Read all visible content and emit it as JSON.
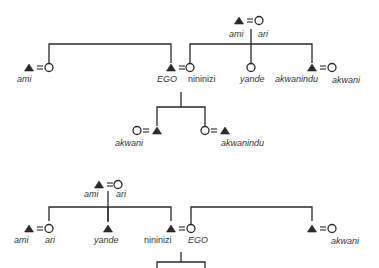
{
  "diagram": {
    "type": "kinship",
    "top": {
      "parents": {
        "male": {
          "label": "ami"
        },
        "female": {
          "label": "ari"
        }
      },
      "left_couple": {
        "male": {
          "label": "ami"
        }
      },
      "ego_couple": {
        "male": {
          "label": "EGO"
        },
        "female": {
          "label": "nininizi"
        }
      },
      "siblings_of_wife": [
        {
          "sex": "female",
          "label": "yande"
        },
        {
          "sex": "male",
          "label": "akwanindu",
          "spouse_label": "akwani"
        }
      ],
      "children": [
        {
          "label": "akwani"
        },
        {
          "label": "akwanindu"
        }
      ]
    },
    "bottom": {
      "parents": {
        "male": {
          "label": "ami"
        },
        "female": {
          "label": "ari"
        }
      },
      "children": [
        {
          "male_label": "ami",
          "female_label": "ari"
        },
        {
          "sex": "male",
          "label": "yande"
        },
        {
          "male_label": "nininizi",
          "female_label": "EGO"
        }
      ],
      "right_couple": {
        "female_label": "akwani"
      }
    }
  }
}
